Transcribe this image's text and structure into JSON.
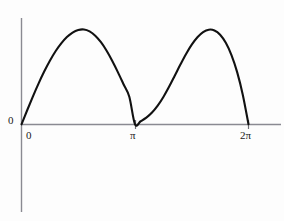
{
  "figure": {
    "background_color": "#fdfdfd",
    "curve_color": "#111111",
    "axis_color": "#8a8a92",
    "tick_color": "#6f6f76"
  },
  "chart_data": {
    "type": "line",
    "title": "",
    "subtitle": "",
    "xlabel": "",
    "ylabel": "",
    "grid": false,
    "legend": null,
    "legend_position": "none",
    "annotations": [],
    "xlim": [
      0,
      6.283185307179586
    ],
    "ylim": [
      0,
      1
    ],
    "x_tick_labels": [
      "0",
      "π",
      "2π"
    ],
    "x_tick_values": [
      0,
      3.141592653589793,
      6.283185307179586
    ],
    "y_tick_labels": [
      "0"
    ],
    "y_tick_values": [
      0
    ],
    "origin_label": "0",
    "series": [
      {
        "name": "curve",
        "x": [
          0,
          0.1571,
          0.3142,
          0.4712,
          0.6283,
          0.7854,
          0.9425,
          1.0996,
          1.2566,
          1.4137,
          1.5708,
          1.7279,
          1.885,
          2.042,
          2.1991,
          2.3562,
          2.5133,
          2.6704,
          2.8274,
          2.9845,
          3.1416,
          3.2987,
          3.4558,
          3.6128,
          3.7699,
          3.927,
          4.0841,
          4.2412,
          4.3982,
          4.5553,
          4.7124,
          4.8695,
          5.0265,
          5.1836,
          5.3407,
          5.4978,
          5.6549,
          5.8119,
          5.969,
          6.1261,
          6.2832
        ],
        "y": [
          0,
          0.148,
          0.292,
          0.429,
          0.556,
          0.67,
          0.77,
          0.853,
          0.92,
          0.968,
          0.995,
          1.0,
          0.98,
          0.935,
          0.866,
          0.776,
          0.668,
          0.548,
          0.42,
          0.29,
          0.0,
          0.032,
          0.07,
          0.124,
          0.196,
          0.288,
          0.395,
          0.512,
          0.63,
          0.742,
          0.84,
          0.918,
          0.972,
          0.998,
          0.99,
          0.945,
          0.86,
          0.73,
          0.55,
          0.31,
          0.0
        ]
      }
    ],
    "peaks": [
      {
        "x_px": 74,
        "x_value": 1.7279,
        "y_value": 1.0
      },
      {
        "x_px": 196,
        "x_value": 5.1836,
        "y_value": 1.0
      }
    ],
    "minima": [
      {
        "x_value": 3.141592653589793,
        "y_value": 0
      },
      {
        "x_value": 6.283185307179586,
        "y_value": 0
      }
    ]
  }
}
